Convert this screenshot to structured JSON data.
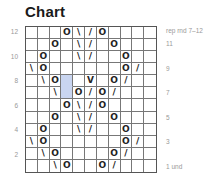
{
  "title": "Chart",
  "repeat_label": "rep rnd 7–12",
  "left_row_numbers": [
    {
      "label": "12",
      "row": 12
    },
    {
      "label": "10",
      "row": 10
    },
    {
      "label": "8",
      "row": 8
    },
    {
      "label": "6",
      "row": 6
    },
    {
      "label": "4",
      "row": 4
    },
    {
      "label": "2",
      "row": 2
    }
  ],
  "right_row_labels": [
    {
      "label": "11",
      "row": 11
    },
    {
      "label": "9",
      "row": 9
    },
    {
      "label": "7",
      "row": 7
    },
    {
      "label": "5",
      "row": 5
    },
    {
      "label": "3",
      "row": 3
    },
    {
      "label": "1 und",
      "row": 1
    }
  ],
  "grid": {
    "columns": 11,
    "rows": 12,
    "highlight_color": "#c9d5f0",
    "highlight_cells": [
      [
        8,
        4
      ],
      [
        7,
        4
      ]
    ],
    "chart_rows": [
      {
        "row": 12,
        "cells": [
          "",
          "",
          "",
          "O",
          "\\",
          "/",
          "O",
          "",
          "",
          "",
          ""
        ]
      },
      {
        "row": 11,
        "cells": [
          "",
          "",
          "O",
          "",
          "\\",
          "/",
          "",
          "O",
          "",
          "",
          ""
        ]
      },
      {
        "row": 10,
        "cells": [
          "",
          "O",
          "",
          "",
          "\\",
          "/",
          "",
          "",
          "O",
          "",
          ""
        ]
      },
      {
        "row": 9,
        "cells": [
          "\\",
          "O",
          "",
          "",
          "",
          "",
          "",
          "",
          "O",
          "/",
          ""
        ]
      },
      {
        "row": 8,
        "cells": [
          "",
          "\\",
          "O",
          "",
          "",
          "V",
          "",
          "O",
          "/",
          "",
          ""
        ]
      },
      {
        "row": 7,
        "cells": [
          "",
          "",
          "\\",
          "",
          "O",
          "/",
          "O",
          "/",
          "",
          "",
          ""
        ]
      },
      {
        "row": 6,
        "cells": [
          "",
          "",
          "",
          "O",
          "\\",
          "/",
          "O",
          "",
          "",
          "",
          ""
        ]
      },
      {
        "row": 5,
        "cells": [
          "",
          "",
          "O",
          "",
          "\\",
          "/",
          "",
          "O",
          "",
          "",
          ""
        ]
      },
      {
        "row": 4,
        "cells": [
          "",
          "O",
          "",
          "",
          "\\",
          "/",
          "",
          "",
          "O",
          "",
          ""
        ]
      },
      {
        "row": 3,
        "cells": [
          "\\",
          "O",
          "",
          "",
          "",
          "",
          "",
          "",
          "O",
          "/",
          ""
        ]
      },
      {
        "row": 2,
        "cells": [
          "",
          "\\",
          "O",
          "",
          "",
          "",
          "",
          "O",
          "/",
          "",
          ""
        ]
      },
      {
        "row": 1,
        "cells": [
          "",
          "",
          "\\",
          "O",
          "",
          "",
          "O",
          "/",
          "",
          "",
          ""
        ]
      }
    ]
  }
}
